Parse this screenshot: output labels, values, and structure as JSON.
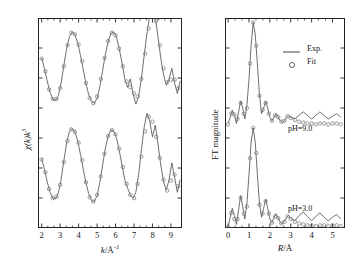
{
  "figure": {
    "background": "#ffffff",
    "line_color": "#555555",
    "marker_color": "#777777"
  },
  "left_panel": {
    "name": "EXAFS k-space spectra",
    "xlabel_italic": "k",
    "xlabel_rest": "/Å",
    "xlabel_sup": "-1",
    "ylabel_italic": "χ(k)k",
    "ylabel_sup": "3",
    "xticks": [
      "2",
      "3",
      "4",
      "5",
      "6",
      "7",
      "8",
      "9"
    ],
    "xlim": [
      1.8,
      9.6
    ],
    "xtick_values": [
      2,
      3,
      4,
      5,
      6,
      7,
      8,
      9
    ],
    "minor_ticks_per_interval": 2
  },
  "right_panel": {
    "name": "Fourier transform magnitude",
    "xlabel_italic": "R",
    "xlabel_rest": "/Å",
    "ylabel": "FT magnitude",
    "xticks": [
      "0",
      "1",
      "2",
      "3",
      "4",
      "5"
    ],
    "xlim": [
      -0.15,
      5.6
    ],
    "xtick_values": [
      0,
      1,
      2,
      3,
      4,
      5
    ],
    "minor_ticks_per_interval": 2,
    "legend": {
      "exp_label": "Exp.",
      "fit_label": "Fit",
      "fit_marker": "o"
    },
    "annotations": {
      "upper": "pH=9.0",
      "lower": "pH=3.0"
    }
  },
  "chart_data": {
    "type": "line",
    "title": "",
    "panels": [
      {
        "id": "left",
        "type": "line",
        "xlabel": "k/Å⁻¹",
        "ylabel": "χ(k)k³",
        "xlim": [
          1.8,
          9.6
        ],
        "ylim": [
          -2.6,
          2.4
        ],
        "grid": false,
        "legend": "none",
        "series": [
          {
            "name": "pH=9.0 Exp.",
            "style": "line",
            "offset": 1.15,
            "x": [
              2.0,
              2.15,
              2.3,
              2.45,
              2.6,
              2.75,
              2.9,
              3.05,
              3.2,
              3.35,
              3.5,
              3.65,
              3.8,
              3.95,
              4.1,
              4.25,
              4.4,
              4.55,
              4.7,
              4.85,
              5.0,
              5.15,
              5.3,
              5.45,
              5.6,
              5.75,
              5.9,
              6.05,
              6.2,
              6.35,
              6.5,
              6.65,
              6.8,
              6.95,
              7.1,
              7.25,
              7.4,
              7.55,
              7.7,
              7.85,
              8.0,
              8.15,
              8.3,
              8.45,
              8.6,
              8.75,
              8.9,
              9.05,
              9.2,
              9.35,
              9.5
            ],
            "y": [
              0.3,
              0.05,
              -0.25,
              -0.52,
              -0.68,
              -0.72,
              -0.6,
              -0.3,
              0.12,
              0.52,
              0.8,
              0.92,
              0.86,
              0.66,
              0.36,
              0.02,
              -0.32,
              -0.58,
              -0.74,
              -0.78,
              -0.66,
              -0.38,
              0.0,
              0.38,
              0.7,
              0.88,
              0.92,
              0.8,
              0.52,
              0.18,
              -0.2,
              -0.4,
              -0.2,
              -0.55,
              -0.8,
              -0.62,
              -0.2,
              0.35,
              0.88,
              1.3,
              1.5,
              1.28,
              0.8,
              0.3,
              -0.1,
              -0.35,
              -0.2,
              0.05,
              -0.3,
              -0.55,
              -0.25
            ]
          },
          {
            "name": "pH=9.0 Fit",
            "style": "markers",
            "offset": 1.15,
            "x": [
              2.0,
              2.2,
              2.4,
              2.6,
              2.8,
              3.0,
              3.2,
              3.4,
              3.6,
              3.8,
              4.0,
              4.2,
              4.4,
              4.6,
              4.8,
              5.0,
              5.2,
              5.4,
              5.6,
              5.8,
              6.0,
              6.2,
              6.4,
              6.6,
              6.8,
              7.0,
              7.2,
              7.4,
              7.6,
              7.8,
              8.0,
              8.2,
              8.4,
              8.6,
              8.8,
              9.0,
              9.2,
              9.4
            ],
            "y": [
              0.28,
              -0.02,
              -0.45,
              -0.68,
              -0.68,
              -0.42,
              0.1,
              0.6,
              0.9,
              0.86,
              0.62,
              0.22,
              -0.3,
              -0.66,
              -0.78,
              -0.62,
              -0.2,
              0.3,
              0.7,
              0.9,
              0.84,
              0.52,
              0.1,
              -0.26,
              -0.4,
              -0.55,
              -0.62,
              -0.2,
              0.4,
              1.0,
              1.42,
              1.18,
              0.6,
              0.05,
              -0.28,
              -0.22,
              -0.22,
              -0.42
            ]
          },
          {
            "name": "pH=3.0 Exp.",
            "style": "line",
            "offset": -1.15,
            "x": [
              2.0,
              2.15,
              2.3,
              2.45,
              2.6,
              2.75,
              2.9,
              3.05,
              3.2,
              3.35,
              3.5,
              3.65,
              3.8,
              3.95,
              4.1,
              4.25,
              4.4,
              4.55,
              4.7,
              4.85,
              5.0,
              5.15,
              5.3,
              5.45,
              5.6,
              5.75,
              5.9,
              6.05,
              6.2,
              6.35,
              6.5,
              6.65,
              6.8,
              6.95,
              7.1,
              7.25,
              7.4,
              7.55,
              7.7,
              7.85,
              8.0,
              8.15,
              8.3,
              8.45,
              8.6,
              8.75,
              8.9,
              9.05,
              9.2,
              9.35,
              9.5
            ],
            "y": [
              0.2,
              -0.05,
              -0.35,
              -0.6,
              -0.74,
              -0.76,
              -0.62,
              -0.3,
              0.15,
              0.58,
              0.84,
              0.92,
              0.84,
              0.62,
              0.3,
              -0.05,
              -0.38,
              -0.64,
              -0.8,
              -0.82,
              -0.68,
              -0.36,
              0.05,
              0.45,
              0.74,
              0.88,
              0.86,
              0.7,
              0.4,
              0.05,
              -0.3,
              -0.5,
              -0.66,
              -0.74,
              -0.6,
              -0.18,
              0.4,
              0.95,
              1.28,
              1.1,
              0.72,
              1.0,
              0.55,
              0.05,
              -0.35,
              -0.55,
              -0.3,
              0.1,
              -0.25,
              -0.6,
              -0.3
            ]
          },
          {
            "name": "pH=3.0 Fit",
            "style": "markers",
            "offset": -1.15,
            "x": [
              2.0,
              2.2,
              2.4,
              2.6,
              2.8,
              3.0,
              3.2,
              3.4,
              3.6,
              3.8,
              4.0,
              4.2,
              4.4,
              4.6,
              4.8,
              5.0,
              5.2,
              5.4,
              5.6,
              5.8,
              6.0,
              6.2,
              6.4,
              6.6,
              6.8,
              7.0,
              7.2,
              7.4,
              7.6,
              7.8,
              8.0,
              8.2,
              8.4,
              8.6,
              8.8,
              9.0,
              9.2,
              9.4
            ],
            "y": [
              0.18,
              -0.12,
              -0.52,
              -0.74,
              -0.7,
              -0.42,
              0.12,
              0.62,
              0.9,
              0.84,
              0.58,
              0.16,
              -0.36,
              -0.72,
              -0.82,
              -0.66,
              -0.22,
              0.32,
              0.74,
              0.88,
              0.78,
              0.44,
              0.0,
              -0.4,
              -0.66,
              -0.74,
              -0.4,
              0.25,
              0.85,
              1.2,
              1.08,
              0.72,
              0.22,
              -0.3,
              -0.56,
              -0.32,
              -0.18,
              -0.45
            ]
          }
        ]
      },
      {
        "id": "right",
        "type": "line",
        "xlabel": "R/Å",
        "ylabel": "FT magnitude",
        "xlim": [
          -0.15,
          5.6
        ],
        "ylim": [
          0.0,
          2.35
        ],
        "grid": false,
        "legend": "upper-right",
        "series": [
          {
            "name": "pH=9.0 Exp.",
            "style": "line",
            "offset": 1.12,
            "x": [
              0.0,
              0.1,
              0.2,
              0.3,
              0.4,
              0.5,
              0.6,
              0.7,
              0.8,
              0.9,
              1.0,
              1.1,
              1.2,
              1.3,
              1.4,
              1.5,
              1.6,
              1.7,
              1.8,
              1.9,
              2.0,
              2.1,
              2.2,
              2.3,
              2.4,
              2.5,
              2.6,
              2.7,
              2.8,
              2.9,
              3.0,
              3.2,
              3.4,
              3.6,
              3.8,
              4.0,
              4.2,
              4.4,
              4.6,
              4.8,
              5.0,
              5.2,
              5.4
            ],
            "y": [
              0.05,
              0.12,
              0.2,
              0.14,
              0.05,
              0.18,
              0.3,
              0.22,
              0.1,
              0.25,
              0.55,
              0.92,
              1.18,
              1.05,
              0.72,
              0.38,
              0.16,
              0.22,
              0.3,
              0.22,
              0.12,
              0.08,
              0.12,
              0.16,
              0.12,
              0.08,
              0.06,
              0.08,
              0.12,
              0.14,
              0.12,
              0.1,
              0.14,
              0.18,
              0.14,
              0.1,
              0.14,
              0.18,
              0.14,
              0.1,
              0.13,
              0.16,
              0.12
            ]
          },
          {
            "name": "pH=9.0 Fit",
            "style": "markers",
            "offset": 1.12,
            "x": [
              0.0,
              0.15,
              0.3,
              0.45,
              0.6,
              0.75,
              0.9,
              1.05,
              1.2,
              1.35,
              1.5,
              1.65,
              1.8,
              1.95,
              2.1,
              2.25,
              2.4,
              2.55,
              2.7,
              2.85,
              3.0,
              3.2,
              3.4,
              3.6,
              3.8,
              4.0,
              4.2,
              4.4,
              4.6,
              4.8,
              5.0,
              5.2,
              5.4
            ],
            "y": [
              0.04,
              0.16,
              0.15,
              0.1,
              0.28,
              0.16,
              0.22,
              0.72,
              1.18,
              0.92,
              0.36,
              0.2,
              0.28,
              0.16,
              0.08,
              0.14,
              0.12,
              0.07,
              0.08,
              0.13,
              0.11,
              0.09,
              0.07,
              0.06,
              0.05,
              0.05,
              0.04,
              0.05,
              0.05,
              0.04,
              0.05,
              0.05,
              0.04
            ]
          },
          {
            "name": "pH=3.0 Exp.",
            "style": "line",
            "offset": -0.02,
            "x": [
              0.0,
              0.1,
              0.2,
              0.3,
              0.4,
              0.5,
              0.6,
              0.7,
              0.8,
              0.9,
              1.0,
              1.1,
              1.2,
              1.3,
              1.4,
              1.5,
              1.6,
              1.7,
              1.8,
              1.9,
              2.0,
              2.1,
              2.2,
              2.3,
              2.4,
              2.5,
              2.6,
              2.7,
              2.8,
              2.9,
              3.0,
              3.2,
              3.4,
              3.6,
              3.8,
              4.0,
              4.2,
              4.4,
              4.6,
              4.8,
              5.0,
              5.2,
              5.4
            ],
            "y": [
              0.04,
              0.14,
              0.24,
              0.16,
              0.06,
              0.22,
              0.38,
              0.26,
              0.12,
              0.3,
              0.62,
              0.98,
              1.14,
              0.98,
              0.62,
              0.3,
              0.14,
              0.24,
              0.34,
              0.24,
              0.12,
              0.08,
              0.14,
              0.18,
              0.13,
              0.08,
              0.07,
              0.1,
              0.14,
              0.16,
              0.13,
              0.1,
              0.16,
              0.2,
              0.15,
              0.1,
              0.15,
              0.19,
              0.14,
              0.1,
              0.14,
              0.17,
              0.12
            ]
          },
          {
            "name": "pH=3.0 Fit",
            "style": "markers",
            "offset": -0.02,
            "x": [
              0.0,
              0.15,
              0.3,
              0.45,
              0.6,
              0.75,
              0.9,
              1.05,
              1.2,
              1.35,
              1.5,
              1.65,
              1.8,
              1.95,
              2.1,
              2.25,
              2.4,
              2.55,
              2.7,
              2.85,
              3.0,
              3.2,
              3.4,
              3.6,
              3.8,
              4.0,
              4.2,
              4.4,
              4.6,
              4.8,
              5.0,
              5.2,
              5.4
            ],
            "y": [
              0.03,
              0.19,
              0.12,
              0.12,
              0.36,
              0.18,
              0.26,
              0.8,
              1.14,
              0.86,
              0.28,
              0.18,
              0.32,
              0.18,
              0.08,
              0.15,
              0.13,
              0.07,
              0.09,
              0.15,
              0.12,
              0.09,
              0.07,
              0.06,
              0.05,
              0.05,
              0.04,
              0.05,
              0.05,
              0.04,
              0.05,
              0.05,
              0.04
            ]
          }
        ]
      }
    ]
  }
}
